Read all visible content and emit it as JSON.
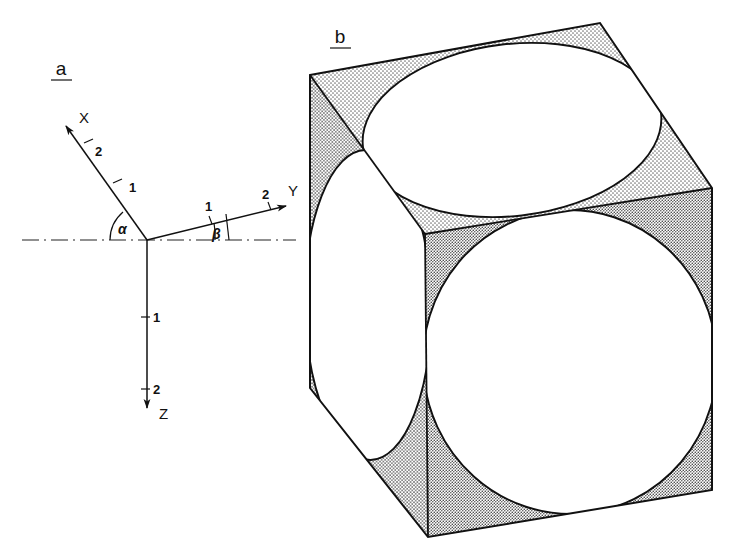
{
  "figure": {
    "title": "",
    "background_color": "#ffffff",
    "line_color": "#111111",
    "stipple_color": "#8c8c8c"
  },
  "panel_a": {
    "label": "a",
    "description": "oblique coordinate axes X, Y, Z with angles alpha and beta",
    "axes": [
      {
        "name": "X",
        "label": "X",
        "ticks": [
          "1",
          "2"
        ]
      },
      {
        "name": "Y",
        "label": "Y",
        "ticks": [
          "1",
          "2"
        ]
      },
      {
        "name": "Z",
        "label": "Z",
        "ticks": [
          "1",
          "2"
        ]
      }
    ],
    "angles": [
      {
        "name": "alpha",
        "label": "α"
      },
      {
        "name": "beta",
        "label": "β"
      }
    ],
    "x_axis": {
      "label": "X",
      "tick_1": "1",
      "tick_2": "2"
    },
    "y_axis": {
      "label": "Y",
      "tick_1": "1",
      "tick_2": "2"
    },
    "z_axis": {
      "label": "Z",
      "tick_1": "1",
      "tick_2": "2"
    },
    "alpha_label": "α",
    "beta_label": "β"
  },
  "panel_b": {
    "label": "b",
    "description": "cube drawn in oblique projection with an inscribed circle on each of the three visible faces; corner regions are stippled"
  }
}
